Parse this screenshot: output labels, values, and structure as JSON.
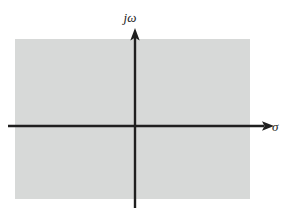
{
  "figure": {
    "name": "complex-s-plane",
    "background_color": "#ffffff",
    "region": {
      "name": "shaded-plane-region",
      "fill_color": "#d7d9d8",
      "x": 15,
      "y": 39,
      "width": 235,
      "height": 160
    },
    "axes": {
      "color": "#1f1f1f",
      "stroke_width": 2.4,
      "origin": {
        "x": 135,
        "y": 126
      },
      "vertical": {
        "name": "imaginary-axis",
        "label": "jω",
        "label_x": 130,
        "label_y": 22,
        "x": 135,
        "y_start": 208,
        "y_end": 30,
        "arrow": "up"
      },
      "horizontal": {
        "name": "real-axis",
        "label": "σ",
        "label_x": 272,
        "label_y": 131,
        "y": 126,
        "x_start": 8,
        "x_end": 268,
        "arrow": "right"
      }
    }
  }
}
